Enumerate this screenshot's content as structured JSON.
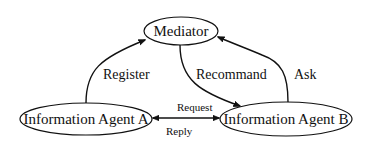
{
  "diagram": {
    "type": "directed-graph",
    "nodes": {
      "mediator": {
        "label": "Mediator"
      },
      "agent_a": {
        "label": "Information Agent A"
      },
      "agent_b": {
        "label": "Information Agent B"
      }
    },
    "edges": {
      "register": {
        "from": "Information Agent A",
        "to": "Mediator",
        "label": "Register"
      },
      "recommand": {
        "from": "Mediator",
        "to": "Information Agent B",
        "label": "Recommand"
      },
      "ask": {
        "from": "Information Agent B",
        "to": "Mediator",
        "label": "Ask"
      },
      "request": {
        "from": "Information Agent A",
        "to": "Information Agent B",
        "label": "Request",
        "bidirectional": true
      },
      "reply": {
        "from": "Information Agent B",
        "to": "Information Agent A",
        "label": "Reply"
      }
    },
    "colors": {
      "stroke": "#111111",
      "background": "#ffffff"
    }
  }
}
